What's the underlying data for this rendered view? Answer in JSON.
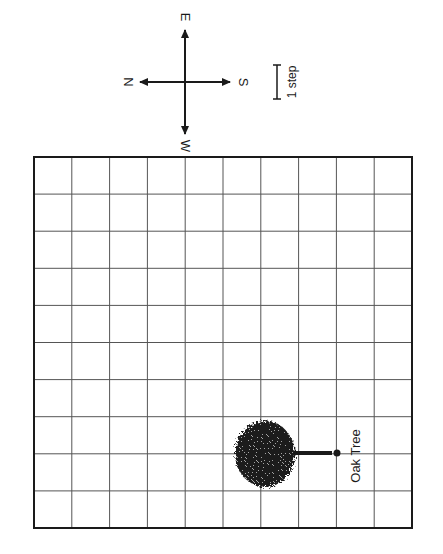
{
  "compass": {
    "north": "N",
    "south": "S",
    "east": "E",
    "west": "W"
  },
  "scale": {
    "label": "1 step"
  },
  "grid": {
    "columns": 10,
    "rows": 10
  },
  "landmark": {
    "label": "Oak Tree",
    "icon": "tree-icon"
  },
  "colors": {
    "line": "#1a1a1a",
    "grid": "#555555",
    "background": "#ffffff"
  }
}
